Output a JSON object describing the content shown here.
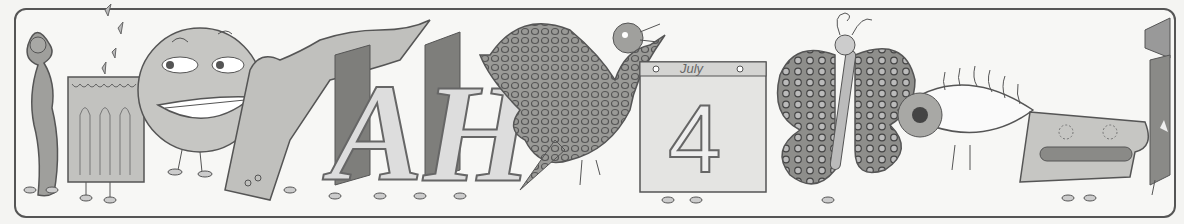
{
  "illustration": {
    "description": "Hand-drawn grayscale frieze of whimsical characters with little legs",
    "figures": [
      {
        "name": "woman-figure"
      },
      {
        "name": "candle"
      },
      {
        "name": "smiling-face"
      },
      {
        "name": "hand"
      },
      {
        "name": "letters-ah",
        "text": "AH"
      },
      {
        "name": "bird"
      },
      {
        "name": "calendar",
        "month": "July",
        "day": "4"
      },
      {
        "name": "butterfly"
      },
      {
        "name": "eye"
      },
      {
        "name": "mouth-face"
      },
      {
        "name": "striped-figure"
      }
    ],
    "colors": {
      "background": "#f7f7f5",
      "ink": "#555555",
      "fill_light": "#cfcfcc",
      "fill_mid": "#a8a8a5",
      "fill_dark": "#7e7e7b"
    }
  }
}
